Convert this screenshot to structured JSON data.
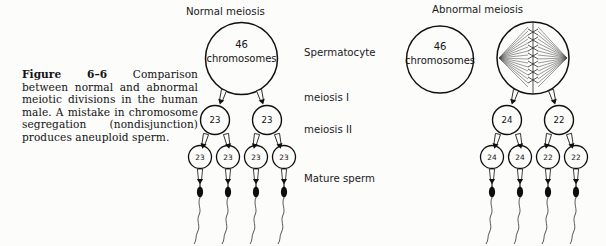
{
  "figure": {
    "caption_label": "Figure 6–6",
    "caption_text": " Comparison between normal and abnormal meiotic divisions in the human male. A mistake in chromosome segregation (nondisjunction) produces aneuploid sperm.",
    "background_color": "#fcfcfb",
    "ink_color": "#101010"
  },
  "columns": [
    {
      "id": "normal",
      "title": "Normal meiosis"
    },
    {
      "id": "abnormal",
      "title": "Abnormal meiosis"
    }
  ],
  "stages": [
    {
      "id": "spermatocyte",
      "label": "Spermatocyte"
    },
    {
      "id": "meiosis-1",
      "label": "meiosis I"
    },
    {
      "id": "meiosis-2",
      "label": "meiosis II"
    },
    {
      "id": "mature-sperm",
      "label": "Mature sperm"
    }
  ],
  "normal": {
    "spermatocyte": {
      "count": "46",
      "unit": "chromosomes"
    },
    "meiosis_1": [
      "23",
      "23"
    ],
    "meiosis_2": [
      "23",
      "23",
      "23",
      "23"
    ],
    "sperm_count": 4
  },
  "abnormal": {
    "spermatocyte": {
      "count": "46",
      "unit": "chromosomes"
    },
    "spindle_cell": {
      "description": "metaphase-spindle-cell"
    },
    "meiosis_1": [
      "24",
      "22"
    ],
    "meiosis_2": [
      "24",
      "24",
      "22",
      "22"
    ],
    "sperm_count": 4
  }
}
